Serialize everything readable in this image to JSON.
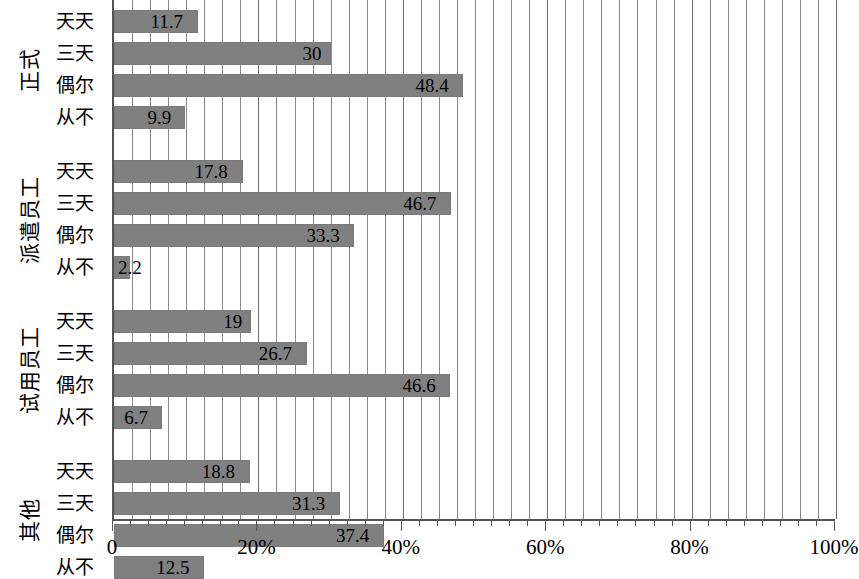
{
  "chart_data": {
    "type": "bar",
    "orientation": "horizontal",
    "title": "",
    "xlabel": "",
    "ylabel": "",
    "xlim": [
      0,
      100
    ],
    "x_tick_labels": [
      "0",
      "20%",
      "40%",
      "60%",
      "80%",
      "100%"
    ],
    "x_tick_values": [
      0,
      20,
      40,
      60,
      80,
      100
    ],
    "minor_tick_step": 2.5,
    "grid": true,
    "grid_axis": "x",
    "legend": null,
    "bar_color": "#808080",
    "categories": [
      "天天",
      "三天",
      "偶尔",
      "从不"
    ],
    "groups": [
      {
        "name": "正式",
        "values": [
          11.7,
          30,
          48.4,
          9.9
        ],
        "value_labels": [
          "11.7",
          "30",
          "48.4",
          "9.9"
        ]
      },
      {
        "name": "派遣员工",
        "values": [
          17.8,
          46.7,
          33.3,
          2.2
        ],
        "value_labels": [
          "17.8",
          "46.7",
          "33.3",
          "2.2"
        ]
      },
      {
        "name": "试用员工",
        "values": [
          19,
          26.7,
          46.6,
          6.7
        ],
        "value_labels": [
          "19",
          "26.7",
          "46.6",
          "6.7"
        ]
      },
      {
        "name": "其他",
        "values": [
          18.8,
          31.3,
          37.4,
          12.5
        ],
        "value_labels": [
          "18.8",
          "31.3",
          "37.4",
          "12.5"
        ]
      }
    ]
  }
}
